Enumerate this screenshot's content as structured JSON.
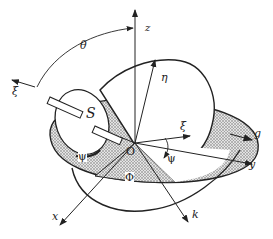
{
  "diagram": {
    "type": "gyroscope-euler-angles",
    "labels": {
      "theta": "θ",
      "xi_axis": "ξ",
      "z": "z",
      "eta": "η",
      "S": "S",
      "xi": "ξ",
      "g": "g",
      "y": "y",
      "psi_left": "ψ",
      "psi_right": "ψ",
      "phi": "Φ",
      "O": "O",
      "x": "x",
      "k": "k"
    },
    "colors": {
      "line": "#222222",
      "hatch": "#9a9a9a",
      "background": "#ffffff"
    }
  }
}
